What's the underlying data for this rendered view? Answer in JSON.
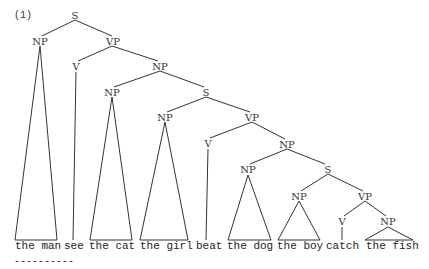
{
  "example_label": "(1)",
  "underline": "----------",
  "nodes": {
    "s0": "S",
    "np1": "NP",
    "vp1": "VP",
    "v1": "V",
    "np2": "NP",
    "np3": "NP",
    "s1": "S",
    "np4": "NP",
    "vp2": "VP",
    "v2": "V",
    "np5": "NP",
    "np6": "NP",
    "s2": "S",
    "np7": "NP",
    "vp3": "VP",
    "v3": "V",
    "np8": "NP"
  },
  "leaves": [
    "the man",
    "see",
    "the cat",
    "the girl",
    "beat",
    "the dog",
    "the boy",
    "catch",
    "the fish"
  ],
  "sentence": "the man see the cat the girl beat the dog the boy catch the fish"
}
